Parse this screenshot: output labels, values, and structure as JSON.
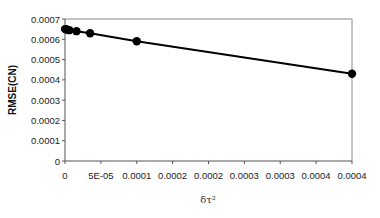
{
  "chart_data": {
    "type": "line",
    "title": "",
    "xlabel": "δτ²",
    "ylabel": "RMSE(CN)",
    "xlim": [
      0,
      0.0004
    ],
    "ylim": [
      0,
      0.0007
    ],
    "x_tick_labels": [
      "0",
      "5E-05",
      "0.0001",
      "0.0002",
      "0.0002",
      "0.0003",
      "0.0003",
      "0.0004",
      "0.0004"
    ],
    "y_tick_labels": [
      "0",
      "0.0001",
      "0.0002",
      "0.0003",
      "0.0004",
      "0.0005",
      "0.0006",
      "0.0007"
    ],
    "grid": false,
    "legend": null,
    "series": [
      {
        "name": "RMSE(CN)",
        "marker": "circle",
        "color": "#000000",
        "x": [
          2e-07,
          1e-06,
          2.5e-06,
          6e-06,
          1.6e-05,
          3.5e-05,
          0.0001,
          0.0004
        ],
        "y": [
          0.00065,
          0.00065,
          0.000648,
          0.000645,
          0.00064,
          0.00063,
          0.00059,
          0.00043
        ]
      }
    ]
  }
}
